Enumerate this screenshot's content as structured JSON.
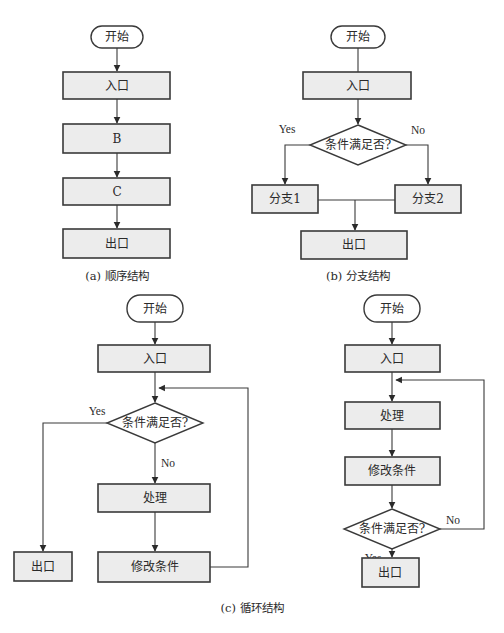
{
  "diagrams": {
    "sequence": {
      "start": "开始",
      "entry": "入口",
      "step_b": "B",
      "step_c": "C",
      "exit": "出口",
      "caption": "(a) 顺序结构"
    },
    "branch": {
      "start": "开始",
      "entry": "入口",
      "condition": "条件满足否?",
      "yes_label": "Yes",
      "no_label": "No",
      "branch1": "分支1",
      "branch2": "分支2",
      "exit": "出口",
      "caption": "(b) 分支结构"
    },
    "loop_while": {
      "start": "开始",
      "entry": "入口",
      "condition": "条件满足否?",
      "yes_label": "Yes",
      "no_label": "No",
      "process": "处理",
      "modify": "修改条件",
      "exit": "出口"
    },
    "loop_do_while": {
      "start": "开始",
      "entry": "入口",
      "process": "处理",
      "modify": "修改条件",
      "condition": "条件满足否?",
      "no_label": "No",
      "yes_label": "Yes",
      "exit": "出口"
    },
    "loop_caption": "(c) 循环结构"
  }
}
